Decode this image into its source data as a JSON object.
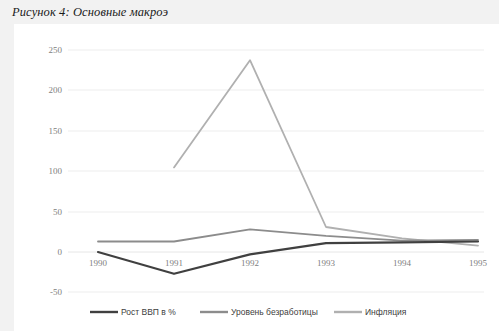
{
  "figure": {
    "title": "Рисунок 4: Основные макроэ"
  },
  "chart_data": {
    "type": "line",
    "title": "Рисунок 4: Основные макроэ",
    "xlabel": "",
    "ylabel": "",
    "categories": [
      "1990",
      "1991",
      "1992",
      "1993",
      "1994",
      "1995"
    ],
    "series": [
      {
        "name": "Рост ВВП в %",
        "color": "#404040",
        "values": [
          0,
          -27,
          -3,
          11,
          12,
          13
        ]
      },
      {
        "name": "Уровень безработицы",
        "color": "#8c8c8c",
        "values": [
          13,
          13,
          28,
          20,
          14,
          15
        ]
      },
      {
        "name": "Инфляция",
        "color": "#b0b0b0",
        "values": [
          null,
          105,
          238,
          31,
          17,
          8
        ]
      }
    ],
    "yticks": [
      "-50",
      "0",
      "50",
      "100",
      "150",
      "200",
      "250"
    ],
    "ylim": [
      -50,
      250
    ],
    "grid": "horizontal",
    "legend_position": "bottom"
  },
  "legend": {
    "items": [
      {
        "label": "Рост ВВП в %",
        "color": "#404040"
      },
      {
        "label": "Уровень безработицы",
        "color": "#8c8c8c"
      },
      {
        "label": "Инфляция",
        "color": "#b0b0b0"
      }
    ]
  },
  "axes": {
    "y_tick_250": "250",
    "y_tick_200": "200",
    "y_tick_150": "150",
    "y_tick_100": "100",
    "y_tick_50": "50",
    "y_tick_0": "0",
    "y_tick_neg50": "-50",
    "x_tick_1990": "1990",
    "x_tick_1991": "1991",
    "x_tick_1992": "1992",
    "x_tick_1993": "1993",
    "x_tick_1994": "1994",
    "x_tick_1995": "1995"
  }
}
